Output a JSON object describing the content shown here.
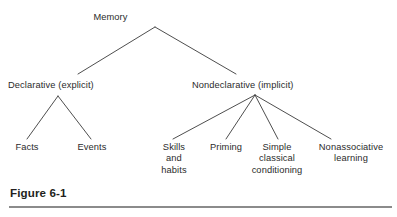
{
  "figure": {
    "caption": "Figure 6-1",
    "line_color": "#3a3a3a",
    "text_color": "#2b2b2b",
    "rule_color": "#8b8b8b",
    "background": "#ffffff"
  },
  "diagram": {
    "type": "tree",
    "root": {
      "label": "Memory"
    },
    "branches": [
      {
        "label": "Declarative (explicit)"
      },
      {
        "label": "Nondeclarative (implicit)"
      }
    ],
    "leaves": [
      {
        "label": "Facts",
        "parent": "Declarative (explicit)"
      },
      {
        "label": "Events",
        "parent": "Declarative (explicit)"
      },
      {
        "label": "Skills\nand\nhabits",
        "parent": "Nondeclarative (implicit)"
      },
      {
        "label": "Priming",
        "parent": "Nondeclarative (implicit)"
      },
      {
        "label": "Simple\nclassical\nconditioning",
        "parent": "Nondeclarative (implicit)"
      },
      {
        "label": "Nonassociative\nlearning",
        "parent": "Nondeclarative (implicit)"
      }
    ]
  }
}
